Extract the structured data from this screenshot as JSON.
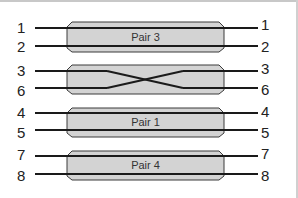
{
  "diagram": {
    "type": "wire-pair-mapping",
    "colors": {
      "wire": "#1a1a1a",
      "box_fill": "#d3d3d3",
      "box_stroke": "#3a3a3a",
      "text": "#222222"
    },
    "rows": [
      {
        "kind": "straight",
        "label": "Pair 3",
        "left_pins": [
          "1",
          "2"
        ],
        "right_pins": [
          "1",
          "2"
        ],
        "y_top": 28,
        "y_bottom": 46
      },
      {
        "kind": "crossed",
        "label": "",
        "left_pins": [
          "3",
          "6"
        ],
        "right_pins": [
          "3",
          "6"
        ],
        "y_top": 71,
        "y_bottom": 88
      },
      {
        "kind": "straight",
        "label": "Pair 1",
        "left_pins": [
          "4",
          "5"
        ],
        "right_pins": [
          "4",
          "5"
        ],
        "y_top": 113,
        "y_bottom": 130
      },
      {
        "kind": "straight",
        "label": "Pair 4",
        "left_pins": [
          "7",
          "8"
        ],
        "right_pins": [
          "7",
          "8"
        ],
        "y_top": 155,
        "y_bottom": 173
      }
    ]
  }
}
